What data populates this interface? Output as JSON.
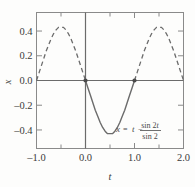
{
  "chart_data": {
    "type": "line",
    "title": "",
    "xlabel": "t",
    "ylabel": "x",
    "xlim": [
      -1.0,
      2.0
    ],
    "ylim": [
      -0.55,
      0.55
    ],
    "grid": false,
    "legend": "none",
    "x_ticks": [
      -1.0,
      -0.5,
      0.0,
      0.5,
      1.0,
      1.5,
      2.0
    ],
    "x_tick_labels": [
      "–1.0",
      "",
      "0.0",
      "",
      "1.0",
      "",
      "2.0"
    ],
    "y_ticks": [
      -0.4,
      -0.2,
      0.0,
      0.2,
      0.4
    ],
    "y_tick_labels": [
      "–0.4",
      "–0.2",
      "0.0",
      "0.2",
      "0.4"
    ],
    "annotation": "x = t − sin 2t / sin 2",
    "annotation_parts": {
      "lhs": "x",
      "equals": "=",
      "term1": "t",
      "minus": "−",
      "numerator_roman": "sin 2",
      "numerator_italic": "t",
      "denominator": "sin 2"
    },
    "series": [
      {
        "name": "solid-branch",
        "style": "solid",
        "color": "#6b6b6b",
        "x_range": [
          0.0,
          1.0
        ],
        "x": [
          0.0,
          0.05,
          0.1,
          0.15,
          0.2,
          0.25,
          0.3,
          0.35,
          0.4,
          0.45,
          0.5,
          0.55,
          0.6,
          0.65,
          0.7,
          0.75,
          0.8,
          0.85,
          0.9,
          0.95,
          1.0
        ],
        "values": [
          0.0,
          -0.06,
          -0.12,
          -0.18,
          -0.24,
          -0.29,
          -0.34,
          -0.38,
          -0.41,
          -0.43,
          -0.43,
          -0.43,
          -0.41,
          -0.38,
          -0.34,
          -0.29,
          -0.24,
          -0.18,
          -0.12,
          -0.06,
          0.0
        ]
      },
      {
        "name": "dashed-branch-left",
        "style": "dashed",
        "color": "#6b6b6b",
        "x_range": [
          -1.0,
          0.0
        ],
        "x": [
          -1.0,
          -0.95,
          -0.9,
          -0.85,
          -0.8,
          -0.75,
          -0.7,
          -0.65,
          -0.6,
          -0.55,
          -0.5,
          -0.45,
          -0.4,
          -0.35,
          -0.3,
          -0.25,
          -0.2,
          -0.15,
          -0.1,
          -0.05,
          0.0
        ],
        "values": [
          0.0,
          0.06,
          0.12,
          0.18,
          0.24,
          0.29,
          0.34,
          0.38,
          0.41,
          0.43,
          0.43,
          0.43,
          0.41,
          0.38,
          0.34,
          0.29,
          0.24,
          0.18,
          0.12,
          0.06,
          0.0
        ]
      },
      {
        "name": "dashed-branch-right",
        "style": "dashed",
        "color": "#6b6b6b",
        "x_range": [
          1.0,
          2.0
        ],
        "x": [
          1.0,
          1.05,
          1.1,
          1.15,
          1.2,
          1.25,
          1.3,
          1.35,
          1.4,
          1.45,
          1.5,
          1.55,
          1.6,
          1.65,
          1.7,
          1.75,
          1.8,
          1.85,
          1.9,
          1.95,
          2.0
        ],
        "values": [
          0.0,
          0.06,
          0.12,
          0.18,
          0.24,
          0.29,
          0.34,
          0.38,
          0.41,
          0.43,
          0.43,
          0.43,
          0.41,
          0.38,
          0.34,
          0.29,
          0.24,
          0.18,
          0.12,
          0.06,
          0.0
        ]
      }
    ],
    "markers": [
      {
        "name": "node-origin",
        "x": 0.0,
        "y": 0.0
      },
      {
        "name": "node-one",
        "x": 1.0,
        "y": 0.0
      }
    ],
    "colors": {
      "curve": "#6b6b6b",
      "axis": "#6b6b6b",
      "frame": "#8a8a8a",
      "text": "#3b3b3b",
      "background": "#fdfdfc"
    }
  }
}
